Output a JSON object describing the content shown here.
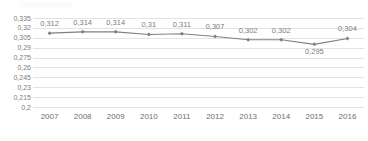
{
  "chart_data": {
    "type": "line",
    "title": "",
    "subtitle": "",
    "xlabel": "",
    "ylabel": "",
    "categories": [
      "2007",
      "2008",
      "2009",
      "2010",
      "2011",
      "2012",
      "2013",
      "2014",
      "2015",
      "2016"
    ],
    "values": [
      0.312,
      0.314,
      0.314,
      0.31,
      0.311,
      0.307,
      0.302,
      0.302,
      0.295,
      0.304
    ],
    "data_labels": [
      "0,312",
      "0,314",
      "0,314",
      "0,31",
      "0,311",
      "0,307",
      "0,302",
      "0,302",
      "0,295",
      "0,304"
    ],
    "data_label_positions": [
      "above",
      "above",
      "above",
      "above",
      "above",
      "above",
      "above",
      "above",
      "below",
      "above"
    ],
    "ylim": [
      0.2,
      0.335
    ],
    "yticks": [
      0.335,
      0.32,
      0.305,
      0.29,
      0.275,
      0.26,
      0.245,
      0.23,
      0.215,
      0.2
    ],
    "ytick_labels": [
      "0,335",
      "0,32",
      "0,305",
      "0,29",
      "0,275",
      "0,26",
      "0,245",
      "0,23",
      "0,215",
      "0,2"
    ],
    "decimal_separator": ",",
    "grid": true,
    "grid_orientation": "horizontal",
    "legend": false,
    "legend_position": "none",
    "series": [
      {
        "name": "series-1",
        "values": [
          0.312,
          0.314,
          0.314,
          0.31,
          0.311,
          0.307,
          0.302,
          0.302,
          0.295,
          0.304
        ],
        "line_color": "#808080",
        "marker_color": "#808080",
        "marker_shape": "diamond"
      }
    ],
    "colors": {
      "line": "#808080",
      "marker": "#808080",
      "gridline": "#e3e3e3",
      "axis": "#b0b0b0",
      "tick_text": "#7d7d7d",
      "data_label_text": "#7d7d7d",
      "background": "#ffffff"
    }
  }
}
